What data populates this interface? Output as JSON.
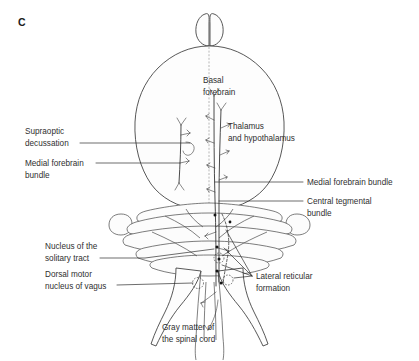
{
  "figure": {
    "panel_letter": "C",
    "type": "anatomical-line-drawing",
    "background_color": "#ffffff",
    "line_color": "#3a3a3a",
    "text_color": "#2f2f2f"
  },
  "labels": {
    "supraoptic_decussation": "Supraoptic\ndecussation",
    "supraoptic_decussation_line1": "Supraoptic",
    "supraoptic_decussation_line2": "decussation",
    "medial_forebrain_bundle_left_line1": "Medial forebrain",
    "medial_forebrain_bundle_left_line2": "bundle",
    "basal_forebrain_line1": "Basal",
    "basal_forebrain_line2": "forebrain",
    "thalamus_line1": "Thalamus",
    "thalamus_line2": "and hypothalamus",
    "medial_forebrain_bundle_right": "Medial forebrain bundle",
    "central_tegmental_bundle_line1": "Central tegmental",
    "central_tegmental_bundle_line2": "bundle",
    "nucleus_solitary_tract_line1": "Nucleus of the",
    "nucleus_solitary_tract_line2": "solitary tract",
    "dorsal_motor_nucleus_line1": "Dorsal motor",
    "dorsal_motor_nucleus_line2": "nucleus of vagus",
    "lateral_reticular_formation_line1": "Lateral reticular",
    "lateral_reticular_formation_line2": "formation",
    "gray_matter_spinal_cord_line1": "Gray matter of",
    "gray_matter_spinal_cord_line2": "the spinal cord"
  },
  "structures": [
    {
      "name": "olfactory-bulbs",
      "description": "paired rounded lobes at rostral tip"
    },
    {
      "name": "cerebrum",
      "description": "large pear-shaped cerebral hemispheres"
    },
    {
      "name": "cerebellum",
      "description": "transversely banded folia with lateral flocculi"
    },
    {
      "name": "brainstem-medulla",
      "description": "tapering brainstem below cerebellum"
    },
    {
      "name": "spinal-cord",
      "description": "narrow caudal continuation"
    }
  ]
}
